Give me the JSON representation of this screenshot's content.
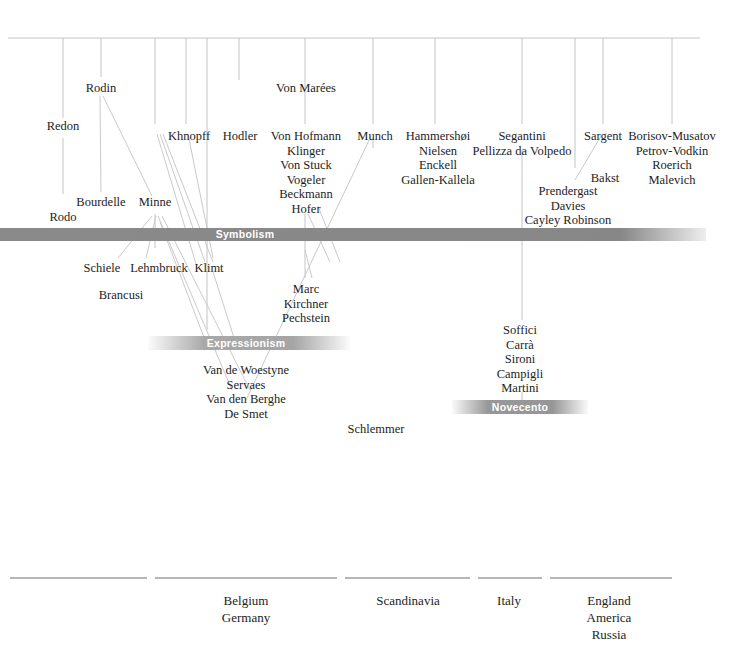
{
  "diagram": {
    "colors": {
      "band_symbolism": "#8a8a8a",
      "band_expressionism": "#aeaeae",
      "band_novecento": "#9b9b9b",
      "band_text": "#ffffff",
      "name_text": "#1d1d1d",
      "rule": "#b9b9b9",
      "axis": "#6f6f6f"
    },
    "bands": [
      {
        "key": "symbolism",
        "label": "Symbolism"
      },
      {
        "key": "expressionism",
        "label": "Expressionism"
      },
      {
        "key": "novecento",
        "label": "Novecento"
      }
    ],
    "names": {
      "redon": [
        "Redon"
      ],
      "rodin": [
        "Rodin"
      ],
      "khnopff": [
        "Khnopff"
      ],
      "hodler": [
        "Hodler"
      ],
      "von_marees": [
        "Von Marées"
      ],
      "german_group": [
        "Von Hofmann",
        "Klinger",
        "Von Stuck",
        "Vogeler",
        "Beckmann",
        "Hofer"
      ],
      "munch": [
        "Munch"
      ],
      "nordic_group": [
        "Hammershøi",
        "Nielsen",
        "Enckell",
        "Gallen-Kallela"
      ],
      "italian_group": [
        "Segantini",
        "Pellizza da Volpedo"
      ],
      "sargent": [
        "Sargent"
      ],
      "russian_group": [
        "Borisov-Musatov",
        "Petrov-Vodkin",
        "Roerich",
        "Malevich"
      ],
      "bakst": [
        "Bakst"
      ],
      "bourdelle": [
        "Bourdelle"
      ],
      "minne": [
        "Minne"
      ],
      "rodo": [
        "Rodo"
      ],
      "american_group": [
        "Prendergast",
        "Davies",
        "Cayley Robinson"
      ],
      "schiele": [
        "Schiele"
      ],
      "lehmbruck": [
        "Lehmbruck"
      ],
      "klimt": [
        "Klimt"
      ],
      "brancusi": [
        "Brancusi"
      ],
      "bruecke_group": [
        "Marc",
        "Kirchner",
        "Pechstein"
      ],
      "novecento_group": [
        "Soffici",
        "Carrà",
        "Sironi",
        "Campigli",
        "Martini"
      ],
      "flemish_group": [
        "Van de Woestyne",
        "Servaes",
        "Van den Berghe",
        "De Smet"
      ],
      "schlemmer": [
        "Schlemmer"
      ]
    },
    "regions": [
      {
        "key": "region-1",
        "labels": []
      },
      {
        "key": "region-2",
        "labels": [
          "Belgium",
          "Germany"
        ]
      },
      {
        "key": "region-3",
        "labels": [
          "Scandinavia"
        ]
      },
      {
        "key": "region-4",
        "labels": [
          "Italy"
        ]
      },
      {
        "key": "region-5",
        "labels": [
          "England",
          "America",
          "Russia"
        ]
      }
    ]
  }
}
